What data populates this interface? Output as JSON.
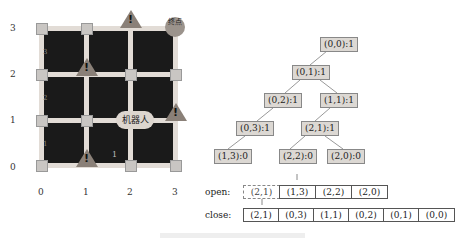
{
  "grid": {
    "x_ticks": [
      "0",
      "1",
      "2",
      "3"
    ],
    "y_ticks": [
      "3",
      "2",
      "1",
      "0"
    ],
    "robot_label": "机器人",
    "goal_label": "终点",
    "warning_glyph": "!",
    "edge_labels": [
      "3",
      "2",
      "1",
      "1"
    ],
    "colors": {
      "board": "#1a1a1a",
      "road": "#e2dcd6",
      "node": "#c9c6c3",
      "obstacle": "#8a8078"
    }
  },
  "tree": {
    "nodes": [
      {
        "label": "(0,0):1"
      },
      {
        "label": "(0,1):1"
      },
      {
        "label": "(0,2):1"
      },
      {
        "label": "(1,1):1"
      },
      {
        "label": "(0,3):1"
      },
      {
        "label": "(2,1):1"
      },
      {
        "label": "(1,3):0"
      },
      {
        "label": "(2,2):0"
      },
      {
        "label": "(2,0):0"
      }
    ]
  },
  "lists": {
    "open": {
      "label": "open:",
      "cells": [
        "(2,1)",
        "(1,3)",
        "(2,2)",
        "(2,0)"
      ],
      "removed_index": 0
    },
    "close": {
      "label": "close:",
      "cells": [
        "(2,1)",
        "(0,3)",
        "(1,1)",
        "(0,2)",
        "(0,1)",
        "(0,0)"
      ]
    }
  }
}
